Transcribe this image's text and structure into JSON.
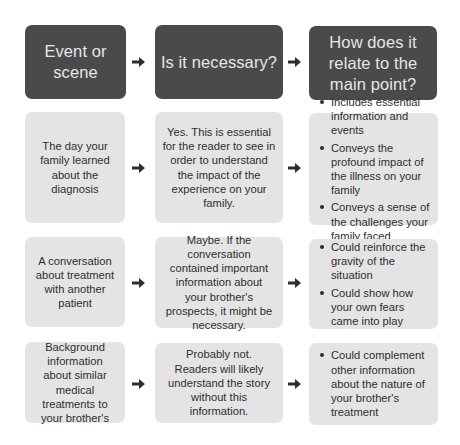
{
  "header": {
    "col1": "Event or scene",
    "col2": "Is it necessary?",
    "col3": "How does it relate to the main point?"
  },
  "rows": [
    {
      "event": "The day your family learned about the diagnosis",
      "necessary": "Yes. This is essential for the reader to see in order to understand the impact of the experience on your family.",
      "relation": [
        "Includes essential information and events",
        "Conveys the profound impact of the illness on your family",
        "Conveys a sense of the challenges your family faced"
      ]
    },
    {
      "event": "A conversation about treatment with another patient",
      "necessary": "Maybe. If the conversation contained important information about your brother's prospects, it might be necessary.",
      "relation": [
        "Could reinforce the gravity of the situation",
        "Could show how your own fears came into play"
      ]
    },
    {
      "event": "Background information about similar medical treatments to your brother's",
      "necessary": "Probably not. Readers will likely understand the story without this information.",
      "relation": [
        "Could complement other information about the nature of your brother's treatment"
      ]
    }
  ],
  "icons": {
    "arrow": "right-arrow-icon"
  },
  "colors": {
    "header_bg": "#4a4a4a",
    "header_text": "#e6e6e6",
    "cell_bg": "#e4e4e4",
    "cell_text": "#2e2e2e",
    "arrow": "#2e2e2e"
  }
}
